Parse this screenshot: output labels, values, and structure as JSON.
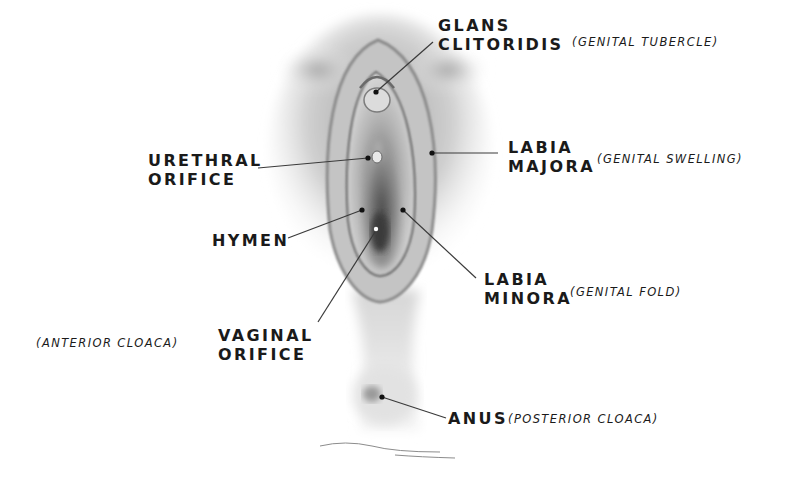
{
  "diagram": {
    "type": "anatomical-illustration",
    "labels": [
      {
        "id": "glans-clitoridis",
        "lines": [
          "GLANS",
          "CLITORIDIS"
        ],
        "note": "(GENITAL TUBERCLE)"
      },
      {
        "id": "urethral-orifice",
        "lines": [
          "URETHRAL",
          "ORIFICE"
        ],
        "note": ""
      },
      {
        "id": "labia-majora",
        "lines": [
          "LABIA",
          "MAJORA"
        ],
        "note": "(GENITAL SWELLING)"
      },
      {
        "id": "hymen",
        "lines": [
          "HYMEN"
        ],
        "note": ""
      },
      {
        "id": "labia-minora",
        "lines": [
          "LABIA",
          "MINORA"
        ],
        "note": "(GENITAL FOLD)"
      },
      {
        "id": "vaginal-orifice",
        "lines": [
          "VAGINAL",
          "ORIFICE"
        ],
        "note": "(ANTERIOR CLOACA)"
      },
      {
        "id": "anus",
        "lines": [
          "ANUS"
        ],
        "note": "(POSTERIOR CLOACA)"
      }
    ]
  }
}
